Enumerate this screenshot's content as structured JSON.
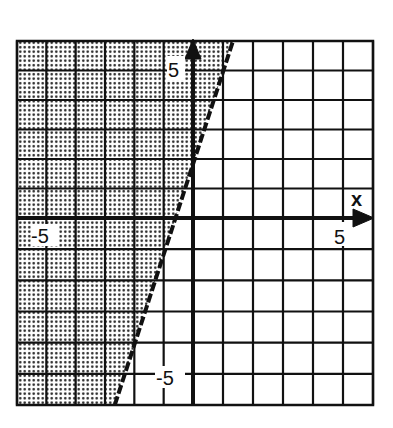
{
  "chart_data": {
    "type": "line",
    "title": "",
    "xlabel": "x",
    "ylabel": "",
    "xlim": [
      -6,
      6
    ],
    "ylim": [
      -6,
      6
    ],
    "grid": true,
    "grid_step": 1,
    "tick_labels": {
      "x": [
        {
          "value": -5,
          "label": "-5"
        },
        {
          "value": 5,
          "label": "5"
        }
      ],
      "y": [
        {
          "value": 5,
          "label": "5"
        },
        {
          "value": -5,
          "label": "-5"
        }
      ]
    },
    "boundary": {
      "equation": "y = 3x + 2",
      "slope": 3,
      "intercept": 2,
      "style": "dashed",
      "points": [
        {
          "x": -2.667,
          "y": -6
        },
        {
          "x": -0.667,
          "y": 0
        },
        {
          "x": 0,
          "y": 2
        },
        {
          "x": 1.333,
          "y": 6
        }
      ]
    },
    "inequality": "y > 3x + 2",
    "shaded_region": "left of / above the boundary line",
    "shading_pattern": "dotted",
    "legend": null
  },
  "labels": {
    "x_axis_name": "x",
    "x_pos_tick": "5",
    "x_neg_tick": "-5",
    "y_pos_tick": "5",
    "y_neg_tick": "-5"
  },
  "colors": {
    "ink": "#111111",
    "background": "#ffffff",
    "shade_dot": "#222222"
  }
}
